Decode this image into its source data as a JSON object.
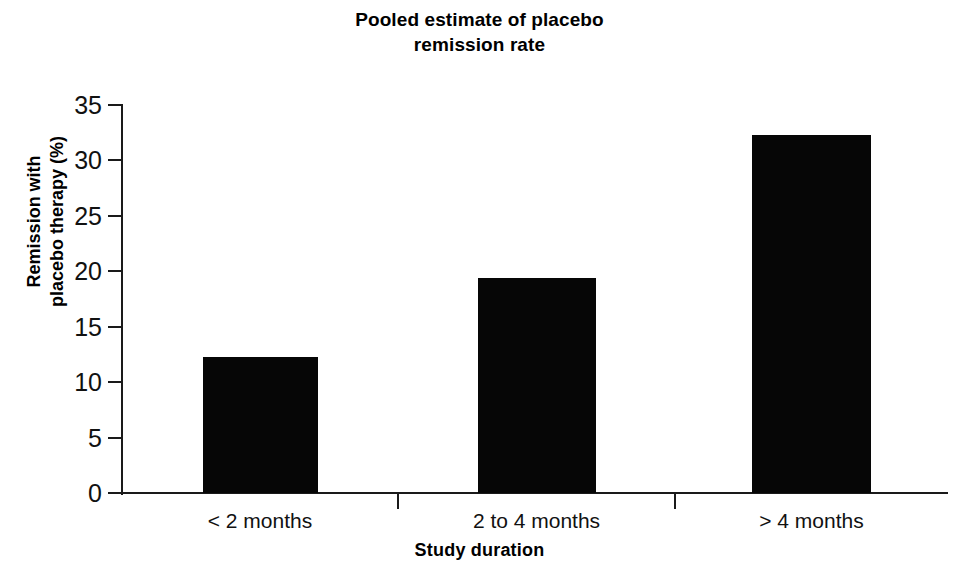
{
  "chart_data": {
    "type": "bar",
    "title": "Pooled estimate of placebo\nremission rate",
    "title_line1": "Pooled estimate of placebo",
    "title_line2": "remission rate",
    "xlabel": "Study duration",
    "ylabel": "Remission with\nplacebo therapy (%)",
    "ylabel_line1": "Remission with",
    "ylabel_line2": "placebo therapy (%)",
    "categories": [
      "< 2 months",
      "2 to 4 months",
      "> 4 months"
    ],
    "values": [
      12.3,
      19.4,
      32.3
    ],
    "ylim": [
      0,
      35
    ],
    "yticks": [
      0,
      5,
      10,
      15,
      20,
      25,
      30,
      35
    ],
    "ytick_labels": [
      "0",
      "5",
      "10",
      "15",
      "20",
      "25",
      "30",
      "35"
    ],
    "grid": false,
    "legend": null,
    "bar_color": "#060606",
    "axis_color": "#1a1a1a",
    "background_color": "#ffffff"
  }
}
